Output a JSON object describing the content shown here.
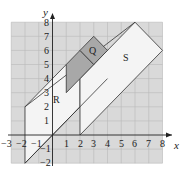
{
  "axes": {
    "x_label": "x",
    "y_label": "y",
    "x_ticks": [
      "−3",
      "−2",
      "−1",
      "1",
      "2",
      "3",
      "4",
      "5",
      "6",
      "7",
      "8"
    ],
    "y_ticks": [
      "8",
      "7",
      "6",
      "5",
      "4",
      "3",
      "2",
      "1",
      "−1",
      "−2"
    ],
    "x_range": [
      -3,
      8
    ],
    "y_range": [
      -2,
      8
    ]
  },
  "shapes": {
    "Q": {
      "label": "Q",
      "vertices": [
        [
          2,
          6
        ],
        [
          3,
          7
        ],
        [
          4,
          6
        ],
        [
          3,
          5
        ]
      ]
    },
    "R": {
      "label": "R",
      "vertices": [
        [
          -2,
          -2
        ],
        [
          -2,
          2
        ],
        [
          1,
          5
        ],
        [
          3,
          5
        ],
        [
          4,
          4
        ],
        [
          2,
          4
        ],
        [
          2,
          2
        ],
        [
          0,
          0
        ]
      ]
    },
    "S": {
      "label": "S",
      "vertices": [
        [
          2,
          0
        ],
        [
          2,
          4
        ],
        [
          6,
          8
        ],
        [
          8,
          6
        ],
        [
          2,
          0
        ]
      ]
    },
    "dark_region": {
      "vertices": [
        [
          1,
          3
        ],
        [
          1,
          5
        ],
        [
          2,
          6
        ],
        [
          3,
          5
        ],
        [
          2,
          4
        ]
      ]
    }
  },
  "colors": {
    "grid_bg": "#d9d9d9",
    "grid_line": "#b5b5b5",
    "shape_fill_light": "#f4f4f4",
    "shape_fill_dark": "#a8a8a8",
    "outline": "#333333"
  }
}
